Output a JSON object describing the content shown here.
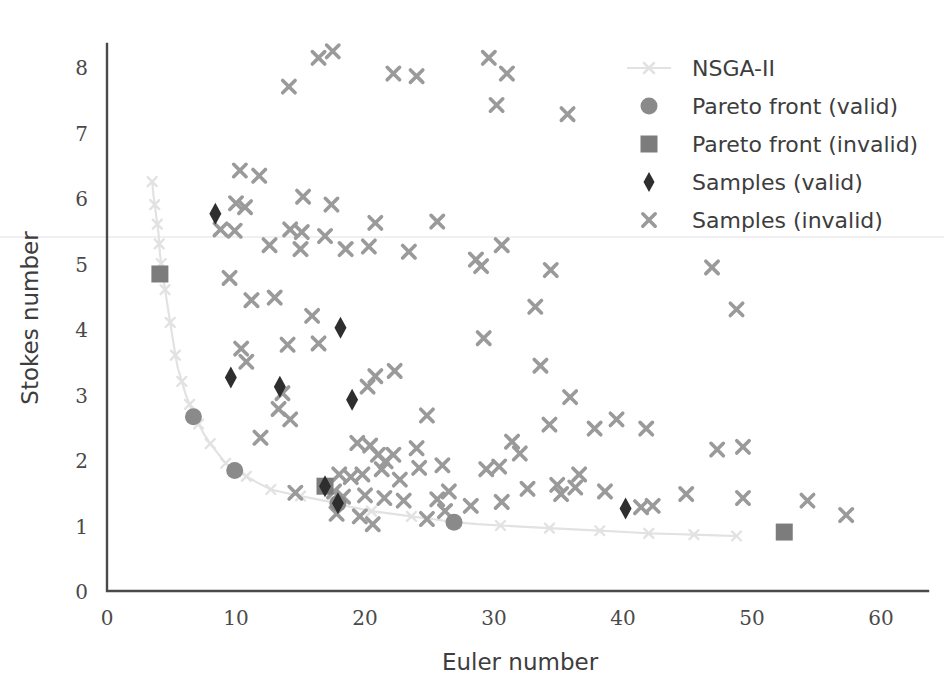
{
  "chart_data": {
    "type": "scatter",
    "title": "",
    "xlabel": "Euler number",
    "ylabel": "Stokes number",
    "xlim": [
      0,
      60
    ],
    "ylim": [
      0,
      8.6
    ],
    "xticks": [
      0,
      10,
      20,
      30,
      40,
      50,
      60
    ],
    "yticks": [
      0,
      1,
      2,
      3,
      4,
      5,
      6,
      7,
      8
    ],
    "grid": false,
    "legend_position": "upper right",
    "colors": {
      "nsga2": "#e2e2e2",
      "pareto_valid": "#8a8a8a",
      "pareto_invalid": "#7c7c7c",
      "samples_valid": "#2e2e2e",
      "samples_invalid": "#9a9a9a",
      "axis": "#4a4a4a",
      "text": "#3d3d3d"
    },
    "series": [
      {
        "name": "NSGA-II",
        "marker": "line-with-markers",
        "color": "#e2e2e2",
        "points": [
          [
            3.5,
            6.25
          ],
          [
            3.6,
            6.05
          ],
          [
            3.7,
            5.9
          ],
          [
            3.8,
            5.75
          ],
          [
            3.9,
            5.6
          ],
          [
            4.0,
            5.45
          ],
          [
            4.05,
            5.3
          ],
          [
            4.1,
            5.15
          ],
          [
            4.2,
            5.0
          ],
          [
            4.3,
            4.85
          ],
          [
            4.5,
            4.6
          ],
          [
            4.7,
            4.35
          ],
          [
            4.9,
            4.1
          ],
          [
            5.1,
            3.85
          ],
          [
            5.3,
            3.6
          ],
          [
            5.5,
            3.4
          ],
          [
            5.8,
            3.2
          ],
          [
            6.1,
            3.0
          ],
          [
            6.4,
            2.85
          ],
          [
            6.7,
            2.7
          ],
          [
            7.1,
            2.55
          ],
          [
            7.5,
            2.4
          ],
          [
            8.0,
            2.25
          ],
          [
            8.6,
            2.1
          ],
          [
            9.2,
            1.95
          ],
          [
            9.9,
            1.85
          ],
          [
            10.8,
            1.75
          ],
          [
            11.7,
            1.65
          ],
          [
            12.7,
            1.55
          ],
          [
            13.8,
            1.5
          ],
          [
            15.0,
            1.45
          ],
          [
            16.3,
            1.4
          ],
          [
            17.6,
            1.35
          ],
          [
            19.0,
            1.28
          ],
          [
            20.5,
            1.22
          ],
          [
            22.0,
            1.18
          ],
          [
            23.6,
            1.14
          ],
          [
            25.2,
            1.1
          ],
          [
            26.9,
            1.05
          ],
          [
            28.7,
            1.02
          ],
          [
            30.5,
            1.0
          ],
          [
            32.4,
            0.98
          ],
          [
            34.3,
            0.96
          ],
          [
            36.2,
            0.94
          ],
          [
            38.2,
            0.92
          ],
          [
            40.2,
            0.9
          ],
          [
            42.0,
            0.88
          ],
          [
            43.8,
            0.87
          ],
          [
            45.5,
            0.86
          ],
          [
            47.2,
            0.85
          ],
          [
            48.8,
            0.84
          ]
        ]
      },
      {
        "name": "Pareto front (valid)",
        "marker": "circle",
        "color": "#8a8a8a",
        "points": [
          [
            6.7,
            2.66
          ],
          [
            9.9,
            1.84
          ],
          [
            17.9,
            1.34
          ],
          [
            26.9,
            1.05
          ]
        ]
      },
      {
        "name": "Pareto front (invalid)",
        "marker": "square",
        "color": "#7c7c7c",
        "points": [
          [
            4.1,
            4.84
          ],
          [
            16.9,
            1.6
          ],
          [
            52.5,
            0.9
          ]
        ]
      },
      {
        "name": "Samples (valid)",
        "marker": "diamond",
        "color": "#2e2e2e",
        "points": [
          [
            8.4,
            5.76
          ],
          [
            9.6,
            3.26
          ],
          [
            18.1,
            4.02
          ],
          [
            13.4,
            3.12
          ],
          [
            19.0,
            2.92
          ],
          [
            16.9,
            1.6
          ],
          [
            17.9,
            1.34
          ],
          [
            40.2,
            1.26
          ]
        ]
      },
      {
        "name": "Samples (invalid)",
        "marker": "x",
        "color": "#9a9a9a",
        "points": [
          [
            16.4,
            8.14
          ],
          [
            17.5,
            8.24
          ],
          [
            14.1,
            7.7
          ],
          [
            22.2,
            7.9
          ],
          [
            24.0,
            7.86
          ],
          [
            29.6,
            8.14
          ],
          [
            31.0,
            7.9
          ],
          [
            30.2,
            7.42
          ],
          [
            35.7,
            7.28
          ],
          [
            10.3,
            6.42
          ],
          [
            11.8,
            6.34
          ],
          [
            10.0,
            5.92
          ],
          [
            10.7,
            5.86
          ],
          [
            15.2,
            6.02
          ],
          [
            17.4,
            5.9
          ],
          [
            8.8,
            5.52
          ],
          [
            9.9,
            5.5
          ],
          [
            14.2,
            5.52
          ],
          [
            15.1,
            5.48
          ],
          [
            16.9,
            5.42
          ],
          [
            20.8,
            5.62
          ],
          [
            25.6,
            5.64
          ],
          [
            12.6,
            5.28
          ],
          [
            15.0,
            5.22
          ],
          [
            18.5,
            5.22
          ],
          [
            20.3,
            5.26
          ],
          [
            23.4,
            5.18
          ],
          [
            28.6,
            5.06
          ],
          [
            29.0,
            4.96
          ],
          [
            30.6,
            5.28
          ],
          [
            9.5,
            4.78
          ],
          [
            11.2,
            4.44
          ],
          [
            13.0,
            4.48
          ],
          [
            15.9,
            4.2
          ],
          [
            33.2,
            4.34
          ],
          [
            34.4,
            4.9
          ],
          [
            46.9,
            4.94
          ],
          [
            48.8,
            4.3
          ],
          [
            10.4,
            3.7
          ],
          [
            10.8,
            3.5
          ],
          [
            14.0,
            3.76
          ],
          [
            16.4,
            3.78
          ],
          [
            29.2,
            3.86
          ],
          [
            13.6,
            3.02
          ],
          [
            13.3,
            2.78
          ],
          [
            14.2,
            2.62
          ],
          [
            20.2,
            3.12
          ],
          [
            20.8,
            3.28
          ],
          [
            22.3,
            3.36
          ],
          [
            24.8,
            2.68
          ],
          [
            33.6,
            3.44
          ],
          [
            35.9,
            2.96
          ],
          [
            11.9,
            2.34
          ],
          [
            19.4,
            2.26
          ],
          [
            20.4,
            2.22
          ],
          [
            21.0,
            2.08
          ],
          [
            21.6,
            1.98
          ],
          [
            22.2,
            2.08
          ],
          [
            24.0,
            2.18
          ],
          [
            26.0,
            1.92
          ],
          [
            31.4,
            2.28
          ],
          [
            32.0,
            2.1
          ],
          [
            34.3,
            2.54
          ],
          [
            37.8,
            2.48
          ],
          [
            39.5,
            2.62
          ],
          [
            41.8,
            2.48
          ],
          [
            47.3,
            2.16
          ],
          [
            49.3,
            2.2
          ],
          [
            18.0,
            1.78
          ],
          [
            18.9,
            1.74
          ],
          [
            19.8,
            1.78
          ],
          [
            21.3,
            1.86
          ],
          [
            22.7,
            1.7
          ],
          [
            24.2,
            1.88
          ],
          [
            29.4,
            1.86
          ],
          [
            30.4,
            1.9
          ],
          [
            34.9,
            1.62
          ],
          [
            36.6,
            1.78
          ],
          [
            14.6,
            1.5
          ],
          [
            17.6,
            1.52
          ],
          [
            18.3,
            1.44
          ],
          [
            20.0,
            1.46
          ],
          [
            21.5,
            1.42
          ],
          [
            23.0,
            1.38
          ],
          [
            25.6,
            1.4
          ],
          [
            26.5,
            1.52
          ],
          [
            28.2,
            1.3
          ],
          [
            30.6,
            1.36
          ],
          [
            32.6,
            1.56
          ],
          [
            35.2,
            1.48
          ],
          [
            36.3,
            1.58
          ],
          [
            38.6,
            1.52
          ],
          [
            41.4,
            1.28
          ],
          [
            42.3,
            1.3
          ],
          [
            44.9,
            1.48
          ],
          [
            49.3,
            1.42
          ],
          [
            54.3,
            1.38
          ],
          [
            57.3,
            1.16
          ],
          [
            17.8,
            1.18
          ],
          [
            19.6,
            1.14
          ],
          [
            24.8,
            1.1
          ],
          [
            26.2,
            1.22
          ],
          [
            20.6,
            1.02
          ]
        ]
      }
    ]
  },
  "legend": {
    "entries": [
      {
        "label": "NSGA-II",
        "marker": "line-with-marker-icon"
      },
      {
        "label": "Pareto front (valid)",
        "marker": "circle-icon"
      },
      {
        "label": "Pareto front (invalid)",
        "marker": "square-icon"
      },
      {
        "label": "Samples (valid)",
        "marker": "diamond-icon"
      },
      {
        "label": "Samples (invalid)",
        "marker": "x-icon"
      }
    ]
  }
}
